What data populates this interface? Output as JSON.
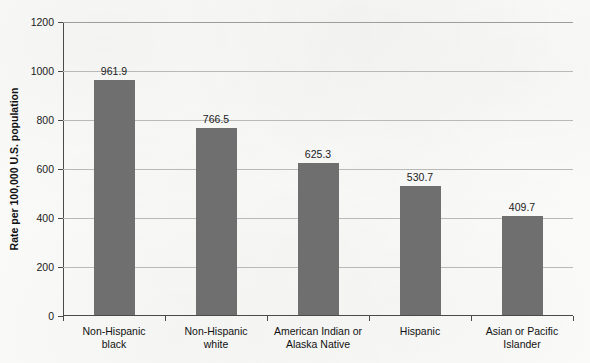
{
  "chart_data": {
    "type": "bar",
    "title": "",
    "xlabel": "",
    "ylabel": "Rate per 100,000 U.S. population",
    "ylim": [
      0,
      1200
    ],
    "ytick_step": 200,
    "yticks": [
      "1200",
      "1000",
      "800",
      "600",
      "400",
      "200",
      "0"
    ],
    "grid": true,
    "legend": "none",
    "bar_color": "#6f6f6f",
    "categories": [
      "Non-Hispanic black",
      "Non-Hispanic white",
      "American Indian or Alaska Native",
      "Hispanic",
      "Asian or Pacific Islander"
    ],
    "category_label_lines": [
      [
        "Non-Hispanic",
        "black"
      ],
      [
        "Non-Hispanic",
        "white"
      ],
      [
        "American Indian or",
        "Alaska Native"
      ],
      [
        "Hispanic",
        ""
      ],
      [
        "Asian or Pacific",
        "Islander"
      ]
    ],
    "values": [
      961.9,
      766.5,
      625.3,
      530.7,
      409.7
    ],
    "value_labels": [
      "961.9",
      "766.5",
      "625.3",
      "530.7",
      "409.7"
    ]
  }
}
